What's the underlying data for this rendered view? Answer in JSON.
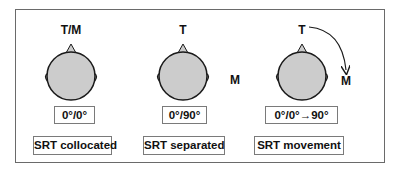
{
  "panels": [
    {
      "target_label": "T/M",
      "masker_label": "",
      "angle": "0°/0°",
      "condition": "SRT collocated"
    },
    {
      "target_label": "T",
      "masker_label": "M",
      "angle": "0°/90°",
      "condition": "SRT separated"
    },
    {
      "target_label": "T",
      "masker_label": "M",
      "angle": "0°/0°→90°",
      "condition": "SRT movement"
    }
  ],
  "colors": {
    "head_fill": "#cccccc",
    "outline": "#1a1a1a",
    "frame": "#6a6a6a"
  }
}
